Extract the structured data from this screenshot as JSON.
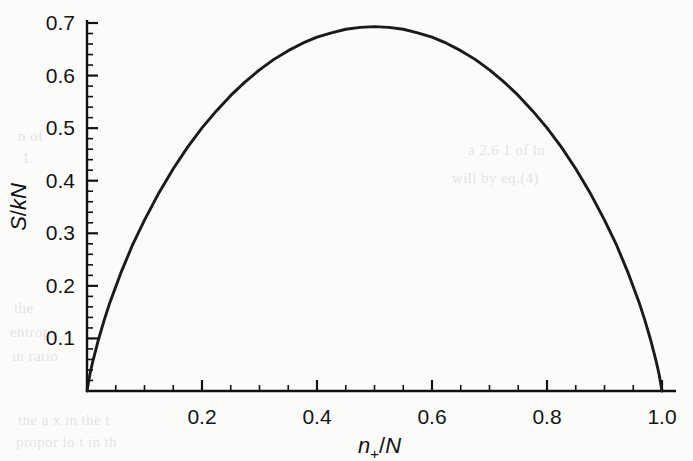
{
  "figure": {
    "background_color": "#fbfbf9",
    "line_color": "#1a1a1a",
    "axis_color": "#111111"
  },
  "ghost_text": [
    {
      "text": "n of",
      "x": 18,
      "y": 128
    },
    {
      "text": "1",
      "x": 22,
      "y": 150
    },
    {
      "text": "a 2.6   1 of ln",
      "x": 468,
      "y": 142
    },
    {
      "text": "will by    eq.(4)",
      "x": 452,
      "y": 170
    },
    {
      "text": "the",
      "x": 14,
      "y": 300
    },
    {
      "text": "entropy",
      "x": 10,
      "y": 324
    },
    {
      "text": "in   ratio",
      "x": 12,
      "y": 348
    },
    {
      "text": "the  a  x  in  the  t",
      "x": 18,
      "y": 412
    },
    {
      "text": "propor    lo   t   in   th",
      "x": 16,
      "y": 434
    }
  ],
  "chart_data": {
    "type": "line",
    "title": "",
    "xlabel": "n+/N",
    "ylabel": "S/kN",
    "xlabel_parts": {
      "italic_a": "n",
      "sub": "+",
      "slash": "/",
      "italic_b": "N"
    },
    "ylabel_parts": {
      "italic_a": "S",
      "slash": "/",
      "roman": "kN"
    },
    "xlim": [
      0,
      1.0
    ],
    "ylim": [
      0,
      0.7
    ],
    "xticks": [
      0.2,
      0.4,
      0.6,
      0.8,
      1.0
    ],
    "xtick_labels": [
      "0.2",
      "0.4",
      "0.6",
      "0.8",
      "1.0"
    ],
    "yticks": [
      0.1,
      0.2,
      0.3,
      0.4,
      0.5,
      0.6,
      0.7
    ],
    "ytick_labels": [
      "0.1",
      "0.2",
      "0.3",
      "0.4",
      "0.5",
      "0.6",
      "0.7"
    ],
    "x_minor_step": 0.05,
    "y_minor_step": 0.02,
    "grid": false,
    "legend": null,
    "peak": {
      "x": 0.5,
      "y": 0.693
    },
    "series": [
      {
        "name": "S/kN = -[p ln p + (1-p) ln(1-p)]",
        "x": [
          0.0,
          0.005,
          0.01,
          0.02,
          0.03,
          0.04,
          0.05,
          0.06,
          0.08,
          0.1,
          0.125,
          0.15,
          0.175,
          0.2,
          0.225,
          0.25,
          0.275,
          0.3,
          0.325,
          0.35,
          0.375,
          0.4,
          0.425,
          0.45,
          0.475,
          0.5,
          0.525,
          0.55,
          0.575,
          0.6,
          0.625,
          0.65,
          0.675,
          0.7,
          0.725,
          0.75,
          0.775,
          0.8,
          0.825,
          0.85,
          0.875,
          0.9,
          0.92,
          0.94,
          0.95,
          0.96,
          0.97,
          0.98,
          0.99,
          0.995,
          1.0
        ],
        "y": [
          0.0,
          0.0314,
          0.056,
          0.098,
          0.1352,
          0.169,
          0.1985,
          0.2276,
          0.28,
          0.3251,
          0.3768,
          0.4227,
          0.4639,
          0.5004,
          0.5328,
          0.5623,
          0.588,
          0.6109,
          0.6308,
          0.6474,
          0.6616,
          0.673,
          0.6813,
          0.6881,
          0.6917,
          0.6931,
          0.6917,
          0.6881,
          0.6813,
          0.673,
          0.6616,
          0.6474,
          0.6308,
          0.6109,
          0.588,
          0.5623,
          0.5328,
          0.5004,
          0.4639,
          0.4227,
          0.3768,
          0.3251,
          0.28,
          0.2276,
          0.1985,
          0.169,
          0.1352,
          0.098,
          0.056,
          0.0314,
          0.0
        ]
      }
    ]
  }
}
